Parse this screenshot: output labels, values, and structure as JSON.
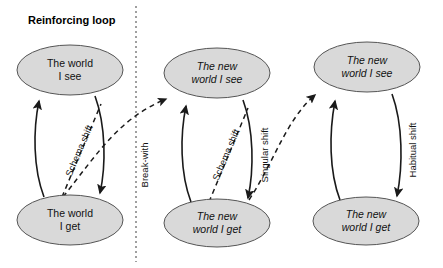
{
  "diagram": {
    "title": "Reinforcing loop",
    "background_color": "#ffffff",
    "node_fill_color": "#d9d9d9",
    "node_stroke_color": "#555555",
    "edge_color": "#1a1a1a",
    "divider_color": "#777777",
    "divider_label": "Break-with",
    "nodes": [
      {
        "id": "left-see",
        "text_line1": "The world",
        "text_line2": "I see",
        "style": "normal"
      },
      {
        "id": "left-get",
        "text_line1": "The world",
        "text_line2": "I get",
        "style": "normal"
      },
      {
        "id": "mid-see",
        "text_line1": "The new",
        "text_line2": "world I see",
        "style": "italic"
      },
      {
        "id": "mid-get",
        "text_line1": "The new",
        "text_line2": "world I get",
        "style": "italic"
      },
      {
        "id": "right-see",
        "text_line1": "The new",
        "text_line2": "world I see",
        "style": "italic"
      },
      {
        "id": "right-get",
        "text_line1": "The new",
        "text_line2": "world I get",
        "style": "italic"
      }
    ],
    "edge_labels": {
      "left_schema_shift": "Schema shift",
      "mid_schema_shift": "Schema shift",
      "singular_shift": "Singular shift",
      "habitual_shift": "Habitual shift",
      "break_with": "Break-with"
    }
  }
}
